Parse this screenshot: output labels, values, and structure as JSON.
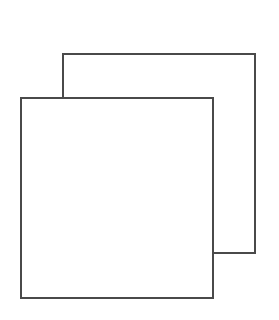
{
  "icon": {
    "name": "copy-icon",
    "stroke_color": "#4a4a4a",
    "background": "#ffffff",
    "back_square": {
      "x": 62,
      "y": 53,
      "width": 194,
      "height": 201
    },
    "front_square": {
      "x": 20,
      "y": 97,
      "width": 194,
      "height": 201
    }
  }
}
